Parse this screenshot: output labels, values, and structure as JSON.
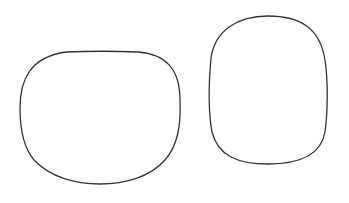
{
  "canvas": {
    "width": 349,
    "height": 203,
    "background": "#ffffff"
  },
  "shapes": [
    {
      "name": "left-rounded-shape",
      "description": "wide rounded blob, flat top, rounded bottom",
      "stroke": "#333333",
      "stroke_width": 1.3,
      "path": "M 66 52 C 90 51, 115 51, 138 52 C 165 54, 180 68, 180 100 C 181 125, 178 145, 165 160 C 150 177, 125 184, 100 184 C 75 184, 50 177, 34 160 C 23 147, 20 128, 20 108 C 20 80, 30 57, 66 52 Z"
    },
    {
      "name": "right-rounded-shape",
      "description": "tall rounded rectangle-like blob",
      "stroke": "#333333",
      "stroke_width": 1.3,
      "path": "M 268 16 C 300 16, 320 28, 325 60 C 328 80, 328 110, 325 132 C 321 155, 300 164, 268 164 C 238 164, 218 156, 212 132 C 208 110, 209 80, 211 58 C 215 30, 238 16, 268 16 Z"
    }
  ]
}
